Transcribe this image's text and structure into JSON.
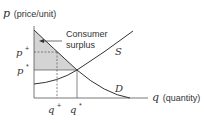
{
  "diagram": {
    "y_axis": {
      "symbol": "p",
      "label": "(price/unit)"
    },
    "x_axis": {
      "symbol": "q",
      "label": "(quantity)"
    },
    "annotation": {
      "line1": "Consumer",
      "line2": "surplus"
    },
    "curves": {
      "supply": "S",
      "demand": "D"
    },
    "ticks": {
      "p_plus_base": "p",
      "p_plus_sup": "+",
      "p_star_base": "p",
      "p_star_sup": "*",
      "q_plus_base": "q",
      "q_plus_sup": "+",
      "q_star_base": "q",
      "q_star_sup": "*"
    },
    "colors": {
      "shade": "#d4d4d4",
      "line": "#333333"
    }
  }
}
